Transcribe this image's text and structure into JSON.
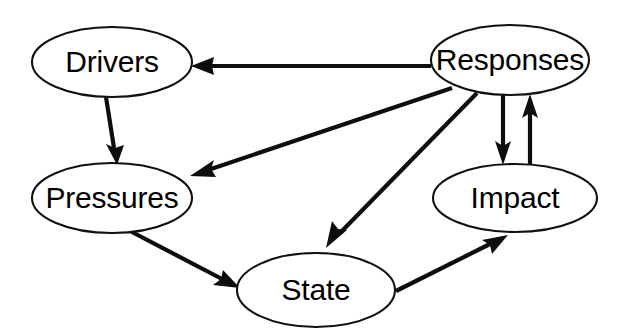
{
  "diagram": {
    "type": "directed-graph",
    "background_color": "#ffffff",
    "stroke_color": "#0d0d0d",
    "label_color": "#000000",
    "nodes": [
      {
        "id": "drivers",
        "label": "Drivers",
        "shape": "ellipse",
        "cx": 112,
        "cy": 62,
        "rx": 80,
        "ry": 35
      },
      {
        "id": "responses",
        "label": "Responses",
        "shape": "ellipse",
        "cx": 510,
        "cy": 60,
        "rx": 79,
        "ry": 35
      },
      {
        "id": "pressures",
        "label": "Pressures",
        "shape": "ellipse",
        "cx": 112,
        "cy": 198,
        "rx": 80,
        "ry": 35
      },
      {
        "id": "impact",
        "label": "Impact",
        "shape": "ellipse",
        "cx": 515,
        "cy": 198,
        "rx": 82,
        "ry": 34
      },
      {
        "id": "state",
        "label": "State",
        "shape": "ellipse",
        "cx": 316,
        "cy": 290,
        "rx": 79,
        "ry": 37
      }
    ],
    "edges": [
      {
        "id": "responses-to-drivers",
        "from": "responses",
        "to": "drivers",
        "style": "straight",
        "arrow": "end"
      },
      {
        "id": "drivers-to-pressures",
        "from": "drivers",
        "to": "pressures",
        "style": "straight",
        "arrow": "end"
      },
      {
        "id": "responses-to-pressures",
        "from": "responses",
        "to": "pressures",
        "style": "straight",
        "arrow": "end"
      },
      {
        "id": "responses-to-state",
        "from": "responses",
        "to": "state",
        "style": "straight",
        "arrow": "end"
      },
      {
        "id": "pressures-to-state",
        "from": "pressures",
        "to": "state",
        "style": "straight",
        "arrow": "end"
      },
      {
        "id": "state-to-impact",
        "from": "state",
        "to": "impact",
        "style": "straight",
        "arrow": "end"
      },
      {
        "id": "responses-to-impact",
        "from": "responses",
        "to": "impact",
        "style": "straight",
        "arrow": "end"
      },
      {
        "id": "impact-to-responses",
        "from": "impact",
        "to": "responses",
        "style": "straight",
        "arrow": "end"
      }
    ]
  }
}
